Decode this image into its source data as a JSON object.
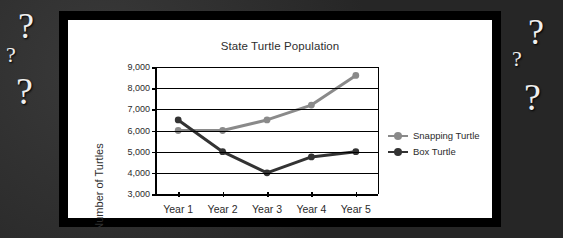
{
  "background": {
    "color": "#2a2a2a",
    "question_marks": [
      {
        "text": "?",
        "x": 18,
        "y": 8,
        "size": 36
      },
      {
        "text": "?",
        "x": 6,
        "y": 44,
        "size": 22
      },
      {
        "text": "?",
        "x": 16,
        "y": 72,
        "size": 38
      },
      {
        "text": "?",
        "x": 528,
        "y": 14,
        "size": 36
      },
      {
        "text": "?",
        "x": 512,
        "y": 48,
        "size": 22
      },
      {
        "text": "?",
        "x": 524,
        "y": 78,
        "size": 38
      }
    ]
  },
  "chart_data": {
    "type": "line",
    "title": "State Turtle Population",
    "xlabel": "",
    "ylabel": "Number of Turtles",
    "categories": [
      "Year 1",
      "Year 2",
      "Year 3",
      "Year 4",
      "Year 5"
    ],
    "ylim": [
      3000,
      9000
    ],
    "yticks": [
      3000,
      4000,
      5000,
      6000,
      7000,
      8000,
      9000
    ],
    "ytick_labels": [
      "3,000",
      "4,000",
      "5,000",
      "6,000",
      "7,000",
      "8,000",
      "9,000"
    ],
    "grid": true,
    "legend_position": "right",
    "series": [
      {
        "name": "Snapping Turtle",
        "color": "#8a8a8a",
        "values": [
          6000,
          6000,
          6500,
          7200,
          8600
        ]
      },
      {
        "name": "Box Turtle",
        "color": "#333333",
        "values": [
          6500,
          5000,
          4000,
          4750,
          5000
        ]
      }
    ]
  }
}
